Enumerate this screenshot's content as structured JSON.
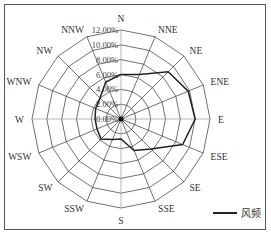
{
  "chart_data": {
    "type": "radar",
    "title": "",
    "categories": [
      "N",
      "NNE",
      "NE",
      "ENE",
      "E",
      "ESE",
      "SE",
      "SSE",
      "S",
      "SSW",
      "SW",
      "WSW",
      "W",
      "WNW",
      "NW",
      "NNW"
    ],
    "series": [
      {
        "name": "风频",
        "values": [
          6.0,
          6.5,
          9.0,
          9.8,
          10.0,
          9.0,
          5.7,
          4.6,
          2.7,
          3.0,
          3.8,
          3.5,
          3.5,
          3.7,
          4.0,
          5.4
        ],
        "color": "#222222"
      }
    ],
    "radial_ticks": [
      "0.00%",
      "2.00%",
      "4.00%",
      "6.00%",
      "8.00%",
      "10.00%",
      "12.00%"
    ],
    "rlim": [
      0,
      12
    ],
    "grid": true,
    "legend_position": "bottom-right"
  },
  "legend": {
    "label": "风频"
  }
}
